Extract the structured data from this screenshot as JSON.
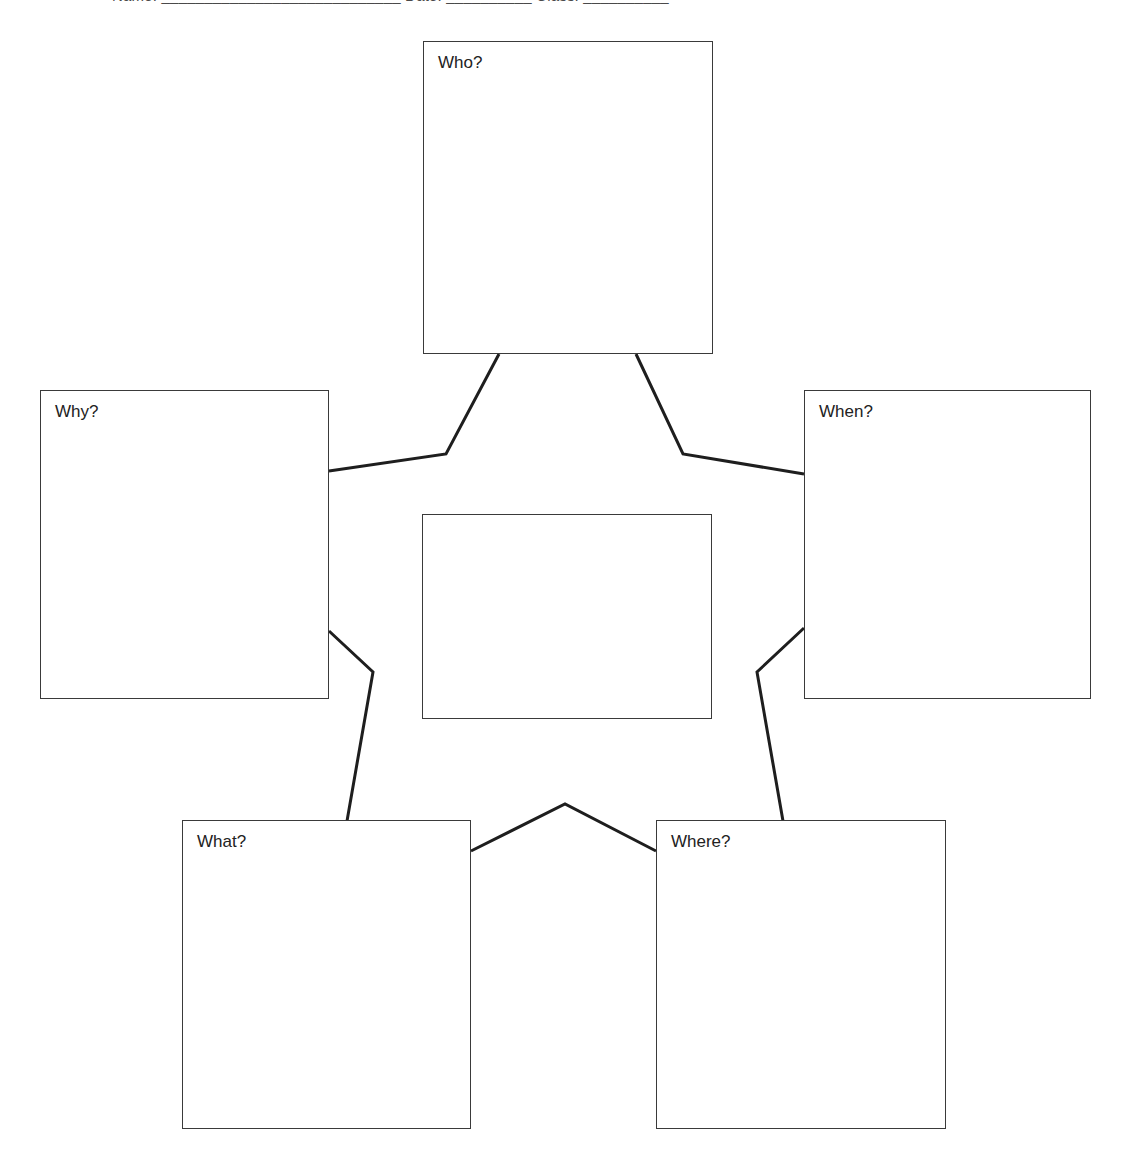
{
  "page": {
    "background_color": "#ffffff",
    "line_color": "#1e1e1e",
    "box_border_color": "#3a3a3a",
    "text_color": "#222222",
    "clipped_top_text": "Name: ____________________________   Date: __________   Class: __________"
  },
  "diagram": {
    "type": "five-ws-web",
    "nodes": [
      {
        "id": "who",
        "label": "Who?",
        "content": "",
        "position": "top-center",
        "x": 423,
        "y": 41,
        "width": 290,
        "height": 313
      },
      {
        "id": "why",
        "label": "Why?",
        "content": "",
        "position": "left-upper",
        "x": 40,
        "y": 390,
        "width": 289,
        "height": 309
      },
      {
        "id": "when",
        "label": "When?",
        "content": "",
        "position": "right-upper",
        "x": 804,
        "y": 390,
        "width": 287,
        "height": 309
      },
      {
        "id": "center",
        "label": "",
        "content": "",
        "position": "center",
        "x": 422,
        "y": 514,
        "width": 290,
        "height": 205
      },
      {
        "id": "what",
        "label": "What?",
        "content": "",
        "position": "bottom-left",
        "x": 182,
        "y": 820,
        "width": 289,
        "height": 309
      },
      {
        "id": "where",
        "label": "Where?",
        "content": "",
        "position": "bottom-right",
        "x": 656,
        "y": 820,
        "width": 290,
        "height": 309
      }
    ],
    "connectors": [
      {
        "id": "who-why",
        "from": "who",
        "to": "why",
        "points": "499,354 446,454 329,471"
      },
      {
        "id": "who-when",
        "from": "who",
        "to": "when",
        "points": "636,354 683,454 804,474"
      },
      {
        "id": "why-what",
        "from": "why",
        "to": "what",
        "points": "329,631 373,672 347,821"
      },
      {
        "id": "when-where",
        "from": "when",
        "to": "where",
        "points": "804,628 757,672 783,821"
      },
      {
        "id": "what-where",
        "from": "what",
        "to": "where",
        "points": "471,851 565,804 656,851"
      }
    ]
  }
}
